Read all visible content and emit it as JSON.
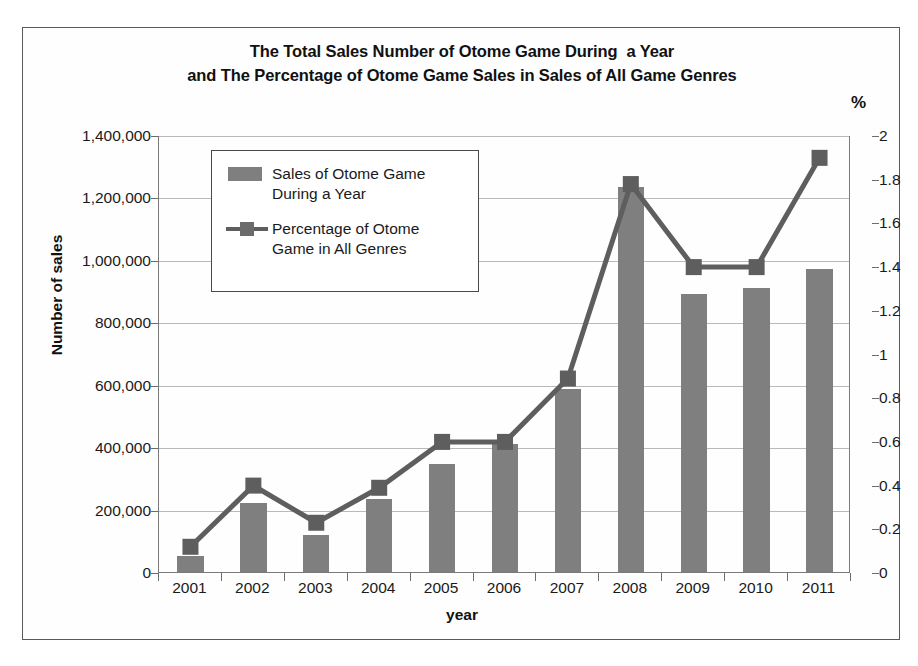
{
  "chart_data": {
    "type": "bar",
    "title": "The Total Sales Number of Otome Game During  a Year and The Percentage of Otome Game Sales in Sales of All Game Genres",
    "title_line1": "The Total Sales Number of Otome Game During  a Year",
    "title_line2": "and The Percentage of Otome Game Sales in Sales of All Game Genres",
    "xlabel": "year",
    "ylabel": "Number of sales",
    "ylabel_secondary": "%",
    "categories": [
      "2001",
      "2002",
      "2003",
      "2004",
      "2005",
      "2006",
      "2007",
      "2008",
      "2009",
      "2010",
      "2011"
    ],
    "series": [
      {
        "name": "Sales of Otome Game During a Year",
        "type": "bar",
        "axis": "left",
        "color": "#7f7f7f",
        "values": [
          50000,
          220000,
          120000,
          235000,
          345000,
          410000,
          585000,
          1235000,
          890000,
          910000,
          970000
        ]
      },
      {
        "name": "Percentage of Otome Game in All Genres",
        "type": "line",
        "axis": "right",
        "color": "#5e5e5e",
        "marker": "square",
        "values": [
          0.12,
          0.4,
          0.23,
          0.39,
          0.6,
          0.6,
          0.89,
          1.78,
          1.4,
          1.4,
          1.9
        ]
      }
    ],
    "ylim": [
      0,
      1400000
    ],
    "ylim_secondary": [
      0,
      2
    ],
    "ytick_labels": [
      "1,400,000",
      "1,200,000",
      "1,000,000",
      "800,000",
      "600,000",
      "400,000",
      "200,000",
      "0"
    ],
    "ytick_values": [
      1400000,
      1200000,
      1000000,
      800000,
      600000,
      400000,
      200000,
      0
    ],
    "ytick_labels_secondary": [
      "2",
      "1.8",
      "1.6",
      "1.4",
      "1.2",
      "1",
      "0.8",
      "0.6",
      "0.4",
      "0.2",
      "0"
    ],
    "ytick_values_secondary": [
      2,
      1.8,
      1.6,
      1.4,
      1.2,
      1,
      0.8,
      0.6,
      0.4,
      0.2,
      0
    ],
    "grid": true,
    "legend_position": "upper-left-inside"
  },
  "legend": {
    "entries": [
      {
        "label_line1": "Sales of Otome Game",
        "label_line2": "During a Year",
        "swatch": "bar-swatch"
      },
      {
        "label_line1": "Percentage of Otome",
        "label_line2": "Game in All Genres",
        "swatch": "line-marker-swatch"
      }
    ]
  },
  "colors": {
    "bar": "#7f7f7f",
    "line": "#5e5e5e",
    "grid": "#b9b9b9",
    "axis": "#6d6d6d",
    "frame": "#5a5a5a",
    "text": "#1a1a1a",
    "background": "#ffffff"
  }
}
